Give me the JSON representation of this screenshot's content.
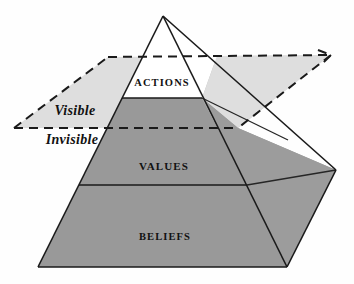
{
  "diagram": {
    "type": "pyramid-diagram",
    "background_color": "#fefefe",
    "colors": {
      "face_shaded": "#999999",
      "face_shaded_right": "#9c9c9c",
      "face_unshaded": "#ffffff",
      "plane": "#dedede",
      "outline": "#1a1a1a",
      "text": "#111111"
    },
    "tiers": [
      {
        "id": "actions",
        "label": "ACTIONS",
        "visibility": "visible",
        "fill": "#ffffff",
        "label_x": 162,
        "label_y": 84
      },
      {
        "id": "values",
        "label": "VALUES",
        "visibility": "invisible",
        "fill": "#999999",
        "label_x": 164,
        "label_y": 167
      },
      {
        "id": "beliefs",
        "label": "BELIEFS",
        "visibility": "invisible",
        "fill": "#999999",
        "label_x": 165,
        "label_y": 238
      }
    ],
    "plane": {
      "id": "waterline-plane",
      "style": "dashed",
      "fill": "#dedede",
      "labels": [
        {
          "id": "visible-label",
          "text": "Visible",
          "position": "above-plane",
          "x": 75,
          "y": 112
        },
        {
          "id": "invisible-label",
          "text": "Invisible",
          "position": "below-plane",
          "x": 72,
          "y": 140
        }
      ]
    },
    "geometry": {
      "apex": [
        163,
        16
      ],
      "front_base_left": [
        38,
        267
      ],
      "front_base_right": [
        287,
        267
      ],
      "right_base_far": [
        336,
        170
      ],
      "actions_base": [
        [
          122,
          98
        ],
        [
          202,
          98
        ]
      ],
      "values_base": [
        [
          79,
          185
        ],
        [
          247,
          185
        ]
      ],
      "ridge_mid": [
        247,
        185
      ],
      "plane_corners": [
        [
          14,
          128
        ],
        [
          108,
          57
        ],
        [
          331,
          55
        ],
        [
          238,
          128
        ]
      ]
    }
  }
}
